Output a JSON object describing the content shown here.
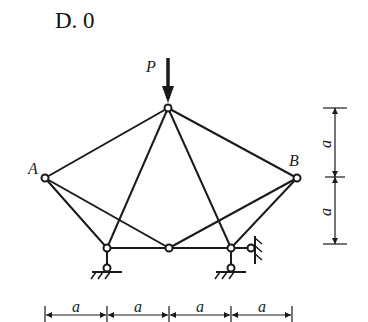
{
  "option": {
    "label": "D. 0"
  },
  "labels": {
    "load": "P",
    "node_a": "A",
    "node_b": "B",
    "dim_vertical_top": "a",
    "dim_vertical_bottom": "a",
    "dim_horizontal": [
      "a",
      "a",
      "a",
      "a"
    ]
  },
  "colors": {
    "line": "#1a1a1a",
    "background": "#ffffff"
  }
}
